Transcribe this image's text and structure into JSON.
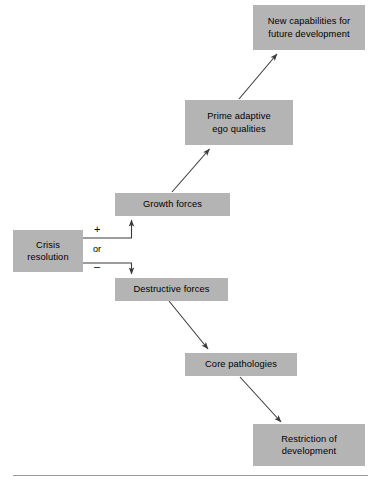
{
  "diagram": {
    "colors": {
      "box_fill": "#b4b4b4",
      "text": "#000000",
      "arrow": "#3b3b3b",
      "rule": "#9a9a9a",
      "background": "#ffffff"
    },
    "nodes": [
      {
        "id": "new-capabilities",
        "label": "New capabilities for\nfuture development",
        "x": 253,
        "y": 5,
        "w": 112,
        "h": 45
      },
      {
        "id": "prime-adaptive-ego-qualities",
        "label": "Prime adaptive\nego qualities",
        "x": 185,
        "y": 100,
        "w": 108,
        "h": 45
      },
      {
        "id": "growth-forces",
        "label": "Growth forces",
        "x": 115,
        "y": 193,
        "w": 115,
        "h": 23
      },
      {
        "id": "crisis-resolution",
        "label": "Crisis\nresolution",
        "x": 13,
        "y": 230,
        "w": 70,
        "h": 42
      },
      {
        "id": "destructive-forces",
        "label": "Destructive forces",
        "x": 115,
        "y": 278,
        "w": 113,
        "h": 23
      },
      {
        "id": "core-pathologies",
        "label": "Core pathologies",
        "x": 185,
        "y": 353,
        "w": 112,
        "h": 23
      },
      {
        "id": "restriction-of-development",
        "label": "Restriction of\ndevelopment",
        "x": 253,
        "y": 424,
        "w": 112,
        "h": 42
      }
    ],
    "branch_labels": {
      "positive": "+",
      "connector": "or",
      "negative": "–"
    },
    "edges": [
      {
        "from": "crisis-resolution",
        "to": "growth-forces",
        "kind": "elbow-up",
        "sign": "+"
      },
      {
        "from": "crisis-resolution",
        "to": "destructive-forces",
        "kind": "elbow-down",
        "sign": "–"
      },
      {
        "from": "growth-forces",
        "to": "prime-adaptive-ego-qualities",
        "kind": "diagonal-up"
      },
      {
        "from": "prime-adaptive-ego-qualities",
        "to": "new-capabilities",
        "kind": "diagonal-up"
      },
      {
        "from": "destructive-forces",
        "to": "core-pathologies",
        "kind": "diagonal-down"
      },
      {
        "from": "core-pathologies",
        "to": "restriction-of-development",
        "kind": "diagonal-down"
      }
    ]
  }
}
